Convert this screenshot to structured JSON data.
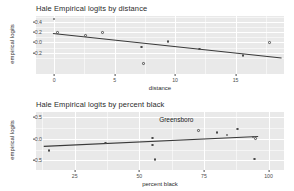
{
  "figure": {
    "background_color": "#ffffff",
    "panel_color": "#e9e9e9",
    "grid_color": "#ffffff",
    "point_color": "#4a4a4a",
    "line_color": "#3a3a3a"
  },
  "chart_data": [
    {
      "type": "scatter",
      "title": "Hale Empirical logits by distance",
      "xlabel": "distance",
      "ylabel": "empirical logits",
      "xlim": [
        -1.5,
        19.0
      ],
      "ylim": [
        -0.62,
        0.52
      ],
      "xticks": [
        "0",
        "5",
        "10",
        "15"
      ],
      "xtickvals": [
        0,
        5,
        10,
        15
      ],
      "yticks": [
        "0.4",
        "0.2",
        "0.0",
        "-0.2"
      ],
      "ytickvals": [
        0.4,
        0.2,
        0.0,
        -0.2
      ],
      "grid": true,
      "legend": "none",
      "x": [
        0.0,
        0.3,
        2.6,
        4.0,
        7.2,
        7.4,
        9.4,
        12.0,
        15.6,
        17.8
      ],
      "y": [
        0.46,
        0.2,
        0.14,
        0.19,
        -0.09,
        -0.41,
        0.02,
        -0.13,
        -0.26,
        0.0
      ],
      "series": [
        {
          "name": "empirical logits",
          "values": [
            0.46,
            0.2,
            0.14,
            0.19,
            -0.09,
            -0.41,
            0.02,
            -0.13,
            -0.26,
            0.0
          ]
        }
      ],
      "fit_line": {
        "name": "linear fit",
        "x_start": -0.1,
        "y_start": 0.175,
        "x_end": 18.8,
        "y_end": -0.305
      },
      "annotations": []
    },
    {
      "type": "scatter",
      "title": "Hale Empirical logits by percent black",
      "xlabel": "percent black",
      "ylabel": "empirical logits",
      "xlim": [
        10.0,
        106.0
      ],
      "ylim": [
        -0.72,
        0.62
      ],
      "xticks": [
        "25",
        "50",
        "75",
        "100"
      ],
      "xtickvals": [
        25,
        50,
        75,
        100
      ],
      "yticks": [
        "0.5",
        "0.0",
        "-0.5"
      ],
      "ytickvals": [
        0.5,
        0.0,
        -0.5
      ],
      "grid": true,
      "legend": "none",
      "x": [
        15.0,
        37.0,
        55.0,
        55.0,
        56.0,
        73.0,
        80.0,
        84.0,
        88.0,
        94.0,
        95.0,
        94.5
      ],
      "y": [
        -0.27,
        -0.1,
        0.02,
        -0.14,
        -0.48,
        0.19,
        0.14,
        0.09,
        0.23,
        0.04,
        0.01,
        -0.47
      ],
      "series": [
        {
          "name": "empirical logits",
          "values": [
            -0.27,
            -0.1,
            0.02,
            -0.14,
            -0.48,
            0.19,
            0.14,
            0.09,
            0.23,
            0.04,
            0.01,
            -0.47
          ]
        }
      ],
      "fit_line": {
        "name": "linear fit",
        "x_start": 13.0,
        "y_start": -0.175,
        "x_end": 96.0,
        "y_end": 0.055
      },
      "annotations": [
        {
          "label": "Greensboro",
          "x": 56.5,
          "y": 0.46
        }
      ]
    }
  ]
}
